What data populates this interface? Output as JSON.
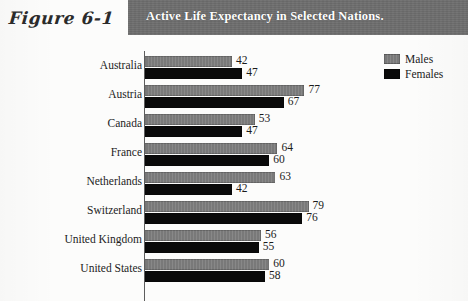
{
  "header": {
    "figure_number": "Figure 6-1",
    "title": "Active Life Expectancy in Selected Nations.",
    "band_color": "#6d6d6d",
    "title_color": "#ffffff"
  },
  "legend": {
    "position": "top-right",
    "items": [
      {
        "label": "Males",
        "color": "#7f7f7f",
        "swatch": "males-swatch"
      },
      {
        "label": "Females",
        "color": "#0a0a0a",
        "swatch": "females-swatch"
      }
    ]
  },
  "chart_data": {
    "type": "bar",
    "orientation": "horizontal",
    "title": "Active Life Expectancy in Selected Nations.",
    "xlabel": "",
    "ylabel": "",
    "grid": false,
    "legend_position": "top-right",
    "xlim": [
      0,
      85
    ],
    "categories": [
      "Australia",
      "Austria",
      "Canada",
      "France",
      "Netherlands",
      "Switzerland",
      "United Kingdom",
      "United States"
    ],
    "series": [
      {
        "name": "Males",
        "color": "#7f7f7f",
        "values": [
          42,
          77,
          53,
          64,
          63,
          79,
          56,
          60
        ]
      },
      {
        "name": "Females",
        "color": "#0a0a0a",
        "values": [
          47,
          67,
          47,
          60,
          42,
          76,
          55,
          58
        ]
      }
    ],
    "rows": [
      {
        "category": "Australia",
        "males": 42,
        "females": 47
      },
      {
        "category": "Austria",
        "males": 77,
        "females": 67
      },
      {
        "category": "Canada",
        "males": 53,
        "females": 47
      },
      {
        "category": "France",
        "males": 64,
        "females": 60
      },
      {
        "category": "Netherlands",
        "males": 63,
        "females": 42
      },
      {
        "category": "Switzerland",
        "males": 79,
        "females": 76
      },
      {
        "category": "United Kingdom",
        "males": 56,
        "females": 55
      },
      {
        "category": "United States",
        "males": 60,
        "females": 58
      }
    ]
  }
}
